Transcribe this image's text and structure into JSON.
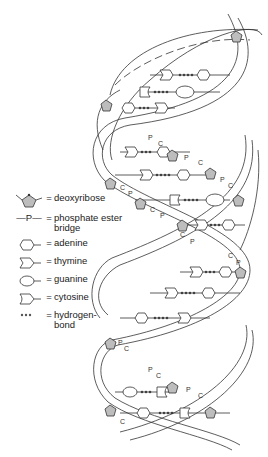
{
  "diagram": {
    "legend": [
      {
        "symbol": "pentagon-deoxyribose-icon",
        "label": "deoxyribose"
      },
      {
        "symbol": "phosphate-bridge-icon",
        "label": "phosphate ester bridge",
        "symbol_text": "P"
      },
      {
        "symbol": "hexagon-adenine-icon",
        "label": "adenine"
      },
      {
        "symbol": "notched-thymine-icon",
        "label": "thymine"
      },
      {
        "symbol": "oval-guanine-icon",
        "label": "guanine"
      },
      {
        "symbol": "crescent-cytosine-icon",
        "label": "cytosine"
      },
      {
        "symbol": "dots-hydrogen-bond-icon",
        "label": "hydrogen-bond"
      }
    ],
    "equals": "=",
    "backbone_labels": {
      "phosphate": "P",
      "carbon": "C"
    },
    "colors": {
      "line": "#333333",
      "sugar_fill": "#bdbdbd",
      "strand_shade": "#ececec"
    }
  }
}
